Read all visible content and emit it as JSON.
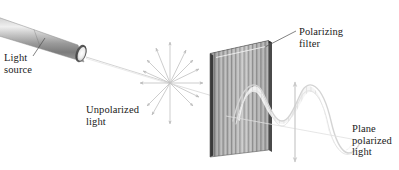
{
  "figure": {
    "kind": "physics-diagram",
    "background_color": "#ffffff"
  },
  "labels": {
    "light_source": "Light\nsource",
    "unpolarized_light": "Unpolarized\nlight",
    "polarizing_filter": "Polarizing\nfilter",
    "plane_polarized_light": "Plane\npolarized\nlight"
  },
  "colors": {
    "text": "#1a1a1a",
    "leader_line": "#5a5a5a",
    "cylinder_dark": "#6f6f6f",
    "cylinder_mid": "#a9a9a9",
    "cylinder_light": "#e3e3e3",
    "cylinder_cap": "#f2f2f2",
    "filter_stripe_dark": "#7e7e7e",
    "filter_stripe_light": "#cfcfcf",
    "filter_edge": "#3c3c3c",
    "beam": "#c9c9c9",
    "starburst_arrow": "#bdbdbd",
    "wave_stroke": "#d8d8d8",
    "wave_fill": "#efefef",
    "polarization_arrow": "#cccccc"
  },
  "elements": {
    "light_source_cylinder": {
      "name": "light-source-cylinder",
      "description": "cylindrical flashlight barrel angled down-right emitting a beam"
    },
    "light_beam": {
      "name": "light-beam-ray",
      "description": "faint ray from the source to the unpolarized light point"
    },
    "unpolarized_starburst": {
      "name": "unpolarized-starburst",
      "description": "arrows radiating in all directions showing random vibration planes",
      "ray_count": 12
    },
    "polarizing_filter": {
      "name": "polarizing-filter-slab",
      "description": "striped rectangular slab in perspective acting as a polarizer",
      "stripe_count": 26
    },
    "plane_wave": {
      "name": "plane-polarized-wave",
      "description": "sinusoidal wave confined to a single vertical plane after the filter",
      "cycles": 1.6
    },
    "polarization_axis_arrow": {
      "name": "polarization-axis-double-arrow",
      "description": "vertical double-headed arrow marking the plane of polarization"
    }
  }
}
